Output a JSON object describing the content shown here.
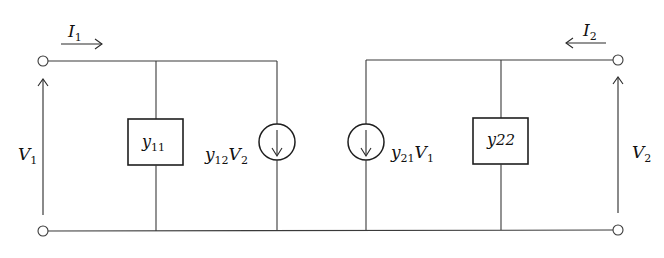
{
  "diagram": {
    "port1": {
      "current_label": {
        "main": "I",
        "sub": "1"
      },
      "voltage_label": {
        "main": "V",
        "sub": "1"
      }
    },
    "port2": {
      "current_label": {
        "main": "I",
        "sub": "2"
      },
      "voltage_label": {
        "main": "V",
        "sub": "2"
      }
    },
    "admittances": [
      {
        "id": "y11",
        "main": "y",
        "sub": "11"
      },
      {
        "id": "y22",
        "main": "y",
        "sub": "22"
      }
    ],
    "sources": [
      {
        "id": "y12V2",
        "main1": "y",
        "sub1": "12",
        "main2": "V",
        "sub2": "2",
        "direction": "down"
      },
      {
        "id": "y21V1",
        "main1": "y",
        "sub1": "21",
        "main2": "V",
        "sub2": "1",
        "direction": "down"
      }
    ],
    "colors": {
      "line": "#3a3a3a",
      "text": "#111111",
      "background": "#ffffff"
    }
  }
}
